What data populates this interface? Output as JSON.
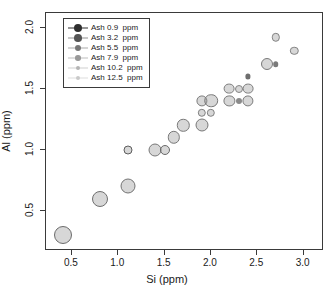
{
  "chart_data": {
    "type": "scatter",
    "title": "",
    "xlabel": "Si (ppm)",
    "ylabel": "Al (ppm)",
    "xlim": [
      0.22,
      3.22
    ],
    "ylim": [
      0.17,
      2.12
    ],
    "xticks": [
      0.5,
      1.0,
      1.5,
      2.0,
      2.5,
      3.0
    ],
    "xticklabels": [
      "0.5",
      "1.0",
      "1.5",
      "2.0",
      "2.5",
      "3.0"
    ],
    "yticks": [
      0.5,
      1.0,
      1.5,
      2.0
    ],
    "yticklabels": [
      "0.5",
      "1.0",
      "1.5",
      "2.0"
    ],
    "grid": false,
    "legend_position": "top-left",
    "size_variable": "Ash",
    "size_units": "ppm",
    "note": "Point size and shade encode Ash concentration: larger and darker = lower Ash, smaller and lighter = higher Ash",
    "points": [
      {
        "x": 0.4,
        "y": 0.3,
        "ash": 0.9,
        "size": 9.0,
        "color": "#6b6b6b"
      },
      {
        "x": 0.8,
        "y": 0.6,
        "ash": 1.6,
        "size": 8.0,
        "color": "#6f6f6f"
      },
      {
        "x": 1.1,
        "y": 0.7,
        "ash": 2.4,
        "size": 7.5,
        "color": "#737373"
      },
      {
        "x": 1.1,
        "y": 1.0,
        "ash": 6.8,
        "size": 4.5,
        "color": "#5e5e5e"
      },
      {
        "x": 1.4,
        "y": 1.0,
        "ash": 4.6,
        "size": 6.5,
        "color": "#787878"
      },
      {
        "x": 1.5,
        "y": 1.0,
        "ash": 6.2,
        "size": 5.0,
        "color": "#6a6a6a"
      },
      {
        "x": 1.6,
        "y": 1.1,
        "ash": 4.9,
        "size": 6.2,
        "color": "#787878"
      },
      {
        "x": 1.7,
        "y": 1.2,
        "ash": 4.9,
        "size": 6.2,
        "color": "#7a7a7a"
      },
      {
        "x": 1.9,
        "y": 1.2,
        "ash": 4.6,
        "size": 6.5,
        "color": "#787878"
      },
      {
        "x": 1.9,
        "y": 1.3,
        "ash": 7.2,
        "size": 4.2,
        "color": "#808080"
      },
      {
        "x": 2.0,
        "y": 1.3,
        "ash": 7.2,
        "size": 4.2,
        "color": "#808080"
      },
      {
        "x": 1.9,
        "y": 1.4,
        "ash": 5.5,
        "size": 5.6,
        "color": "#7c7c7c"
      },
      {
        "x": 2.0,
        "y": 1.4,
        "ash": 4.2,
        "size": 6.8,
        "color": "#787878"
      },
      {
        "x": 2.2,
        "y": 1.4,
        "ash": 5.5,
        "size": 5.6,
        "color": "#7c7c7c"
      },
      {
        "x": 2.3,
        "y": 1.4,
        "ash": 10.2,
        "size": 3.0,
        "color": "#8a8a8a"
      },
      {
        "x": 2.4,
        "y": 1.4,
        "ash": 5.5,
        "size": 5.6,
        "color": "#7c7c7c"
      },
      {
        "x": 2.2,
        "y": 1.5,
        "ash": 5.8,
        "size": 5.4,
        "color": "#7c7c7c"
      },
      {
        "x": 2.3,
        "y": 1.5,
        "ash": 7.9,
        "size": 4.0,
        "color": "#858585"
      },
      {
        "x": 2.4,
        "y": 1.5,
        "ash": 5.8,
        "size": 5.4,
        "color": "#7c7c7c"
      },
      {
        "x": 2.4,
        "y": 1.6,
        "ash": 11.5,
        "size": 2.6,
        "color": "#6e6e6e"
      },
      {
        "x": 2.6,
        "y": 1.7,
        "ash": 5.2,
        "size": 6.0,
        "color": "#7a7a7a"
      },
      {
        "x": 2.7,
        "y": 1.7,
        "ash": 10.8,
        "size": 2.8,
        "color": "#7a7a7a"
      },
      {
        "x": 2.7,
        "y": 1.92,
        "ash": 7.6,
        "size": 4.2,
        "color": "#828282"
      },
      {
        "x": 2.9,
        "y": 1.81,
        "ash": 7.6,
        "size": 4.2,
        "color": "#828282"
      }
    ]
  },
  "legend": {
    "entries": [
      {
        "label": "Ash 0.9  ppm",
        "value": 0.9,
        "size": 4.4,
        "color": "#2e2e2e",
        "line_color": "#2e2e2e"
      },
      {
        "label": "Ash 3.2  ppm",
        "value": 3.2,
        "size": 3.8,
        "color": "#555555",
        "line_color": "#6e6e6e"
      },
      {
        "label": "Ash 5.5  ppm",
        "value": 5.5,
        "size": 3.2,
        "color": "#777777",
        "line_color": "#8e8e8e"
      },
      {
        "label": "Ash 7.9  ppm",
        "value": 7.9,
        "size": 2.8,
        "color": "#999999",
        "line_color": "#a8a8a8"
      },
      {
        "label": "Ash 10.2  ppm",
        "value": 10.2,
        "size": 2.4,
        "color": "#b4b4b4",
        "line_color": "#c0c0c0"
      },
      {
        "label": "Ash 12.5  ppm",
        "value": 12.5,
        "size": 2.2,
        "color": "#c9c9c9",
        "line_color": "#d2d2d2"
      }
    ]
  },
  "colors": {
    "axis": "#3a3a3a",
    "text": "#1a1a1a",
    "background": "#ffffff"
  }
}
